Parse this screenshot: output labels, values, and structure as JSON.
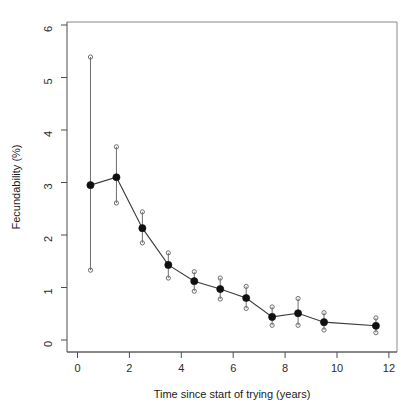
{
  "chart_data": {
    "type": "line",
    "title": "",
    "subtitle": "",
    "xlabel": "Time since start of trying (years)",
    "ylabel": "Fecundability (%)",
    "xlim": [
      -0.3,
      12.5
    ],
    "ylim": [
      -0.1,
      6.3
    ],
    "xticks": [
      0,
      2,
      4,
      6,
      8,
      10,
      12
    ],
    "xtick_labels": [
      "0",
      "2",
      "4",
      "6",
      "8",
      "10",
      "12"
    ],
    "yticks": [
      0,
      1,
      2,
      3,
      4,
      5,
      6
    ],
    "ytick_labels": [
      "0",
      "1",
      "2",
      "3",
      "4",
      "5",
      "6"
    ],
    "grid": false,
    "legend": "none",
    "marker": "filled-circle",
    "error_bar_cap": "open-circle",
    "x": [
      0.5,
      1.5,
      2.5,
      3.5,
      4.5,
      5.5,
      6.5,
      7.5,
      8.5,
      9.5,
      11.5
    ],
    "values": [
      2.95,
      3.1,
      2.13,
      1.43,
      1.12,
      0.97,
      0.8,
      0.44,
      0.51,
      0.34,
      0.27
    ],
    "ci_upper": [
      5.39,
      3.68,
      2.44,
      1.66,
      1.3,
      1.18,
      1.02,
      0.63,
      0.79,
      0.52,
      0.42
    ],
    "ci_lower": [
      1.33,
      2.61,
      1.85,
      1.18,
      0.93,
      0.78,
      0.6,
      0.28,
      0.28,
      0.19,
      0.14
    ],
    "series": [
      {
        "name": "Fecundability",
        "values": [
          2.95,
          3.1,
          2.13,
          1.43,
          1.12,
          0.97,
          0.8,
          0.44,
          0.51,
          0.34,
          0.27
        ]
      }
    ],
    "colors": {
      "line": "#3a3a3a",
      "marker": "#101010",
      "error_bar": "#6e6e6e",
      "axis": "#4d4d4d",
      "background": "#ffffff"
    }
  }
}
